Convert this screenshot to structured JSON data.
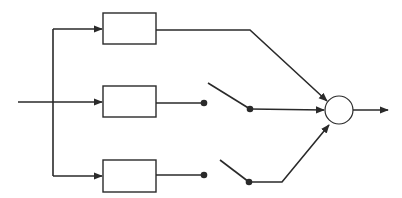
{
  "diagram": {
    "type": "block-diagram",
    "colors": {
      "line": "#2a2a2a",
      "background": "#ffffff"
    },
    "input": {
      "label": ""
    },
    "branches": [
      {
        "id": "branch-1",
        "block_label": "",
        "switch": "none"
      },
      {
        "id": "branch-2",
        "block_label": "",
        "switch": "open"
      },
      {
        "id": "branch-3",
        "block_label": "",
        "switch": "open"
      }
    ],
    "junction": {
      "label": ""
    },
    "output": {
      "label": ""
    }
  }
}
